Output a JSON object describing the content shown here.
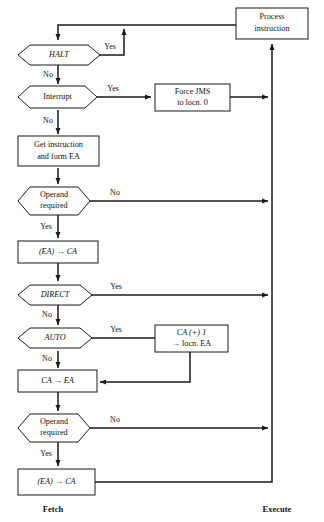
{
  "diagram": {
    "phases": [
      {
        "name": "fetch",
        "label": "Fetch"
      },
      {
        "name": "execute",
        "label": "Execute"
      }
    ],
    "nodes": [
      {
        "id": "process-instruction",
        "type": "process",
        "lines": [
          "Process",
          "instruction"
        ],
        "italic": [
          false,
          false
        ]
      },
      {
        "id": "halt",
        "type": "decision",
        "lines": [
          "HALT"
        ],
        "italic": [
          true
        ]
      },
      {
        "id": "interrupt",
        "type": "decision",
        "lines": [
          "Interrupt"
        ],
        "italic": [
          false
        ]
      },
      {
        "id": "force-jms",
        "type": "process",
        "lines": [
          "Force JMS",
          "to locn. 0"
        ],
        "italic": [
          false,
          false
        ]
      },
      {
        "id": "get-instruction",
        "type": "process",
        "lines": [
          "Get instruction",
          "and form EA"
        ],
        "italic": [
          false,
          false
        ]
      },
      {
        "id": "operand-required-1",
        "type": "decision",
        "lines": [
          "Operand",
          "required"
        ],
        "italic": [
          false,
          false
        ]
      },
      {
        "id": "ea-to-ca-1",
        "type": "process",
        "lines": [
          "(EA) → CA"
        ],
        "italic": [
          true
        ]
      },
      {
        "id": "direct",
        "type": "decision",
        "lines": [
          "DIRECT"
        ],
        "italic": [
          true
        ]
      },
      {
        "id": "auto",
        "type": "decision",
        "lines": [
          "AUTO"
        ],
        "italic": [
          true
        ]
      },
      {
        "id": "ca-plus-one",
        "type": "process",
        "lines": [
          "CA (+) 1",
          "→ locn. EA"
        ],
        "italic": [
          true,
          false
        ]
      },
      {
        "id": "ca-to-ea",
        "type": "process",
        "lines": [
          "CA → EA"
        ],
        "italic": [
          true
        ]
      },
      {
        "id": "operand-required-2",
        "type": "decision",
        "lines": [
          "Operand",
          "required"
        ],
        "italic": [
          false,
          false
        ]
      },
      {
        "id": "ea-to-ca-2",
        "type": "process",
        "lines": [
          "(EA) → CA"
        ],
        "italic": [
          true
        ]
      }
    ],
    "edge_labels": {
      "halt_yes": "Yes",
      "halt_no": "No",
      "interrupt_yes": "Yes",
      "interrupt_no": "No",
      "operand1_no": "No",
      "operand1_yes": "Yes",
      "direct_yes": "Yes",
      "direct_no": "No",
      "auto_yes": "Yes",
      "auto_no": "No",
      "operand2_no": "No",
      "operand2_yes": "Yes"
    },
    "colors": {
      "stroke": "#1a1a1a",
      "fill": "#ffffff",
      "text": "#111111"
    }
  }
}
